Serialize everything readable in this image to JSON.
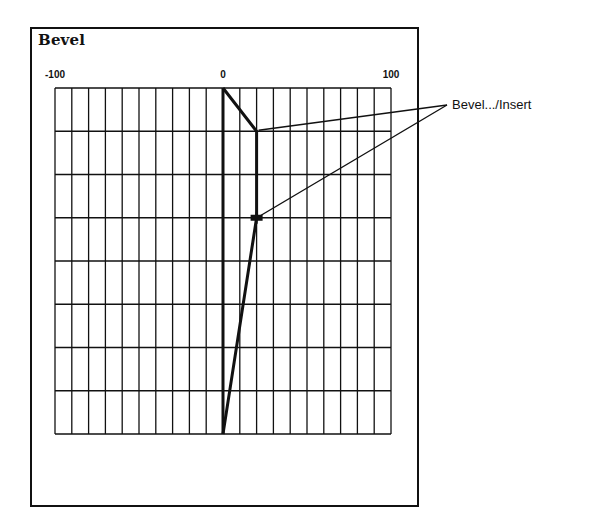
{
  "window": {
    "title": "Bevel"
  },
  "axis": {
    "min": -100,
    "max": 100,
    "tick_labels": [
      "-100",
      "0",
      "100"
    ],
    "tick_values": [
      -100,
      0,
      100
    ],
    "column_step": 10,
    "row_count": 8
  },
  "profile": {
    "description": "Bevel profile polyline (x in axis units, y in grid rows from top)",
    "points": [
      {
        "x": 0,
        "row": 0
      },
      {
        "x": 20,
        "row": 1
      },
      {
        "x": 20,
        "row": 3
      },
      {
        "x": 0,
        "row": 8
      }
    ],
    "node_marker": {
      "x": 20,
      "row": 3
    },
    "baseline_x": 0
  },
  "callout": {
    "label": "Bevel.../Insert",
    "targets": [
      {
        "x": 20,
        "row": 1
      },
      {
        "x": 20,
        "row": 3
      }
    ]
  },
  "colors": {
    "ink": "#111111",
    "background": "#ffffff"
  }
}
